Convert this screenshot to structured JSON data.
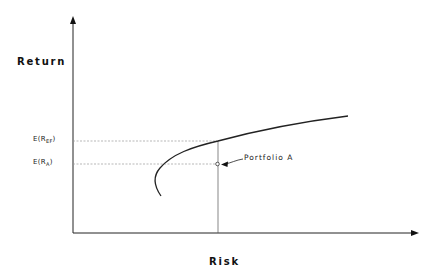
{
  "axes": {
    "y_label": "Return",
    "x_label": "Risk"
  },
  "levels": [
    {
      "id": "ef",
      "prefix": "E(R",
      "subscript": "EF",
      "suffix": ")",
      "y": 141
    },
    {
      "id": "a",
      "prefix": "E(R",
      "subscript": "A",
      "suffix": ")",
      "y": 164
    }
  ],
  "annotation": {
    "label": "Portfolio A"
  },
  "colors": {
    "line": "#222222",
    "guide": "#999999",
    "background": "#ffffff"
  }
}
